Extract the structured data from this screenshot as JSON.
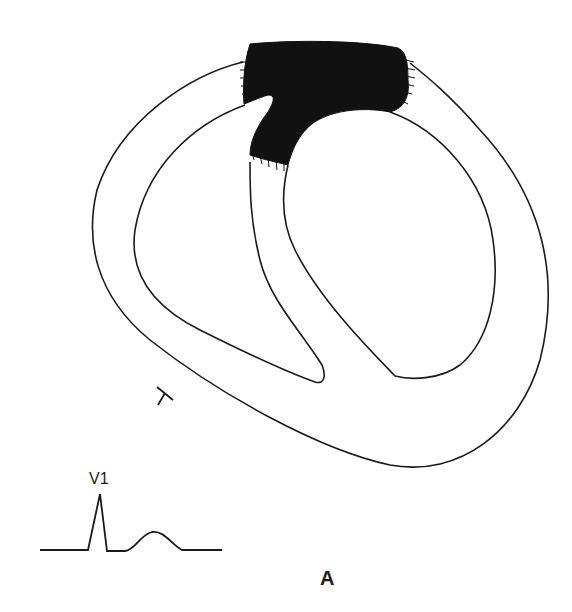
{
  "figure": {
    "panel_label": "A",
    "lead_label": "V1",
    "marker_symbol": "T",
    "colors": {
      "line": "#1a1a1a",
      "shaded_region": "#111111",
      "background": "#ffffff"
    }
  },
  "ecg": {
    "lead": "V1",
    "waveform": [
      "baseline",
      "tall R wave",
      "baseline",
      "T wave (rounded, positive)",
      "baseline"
    ]
  }
}
